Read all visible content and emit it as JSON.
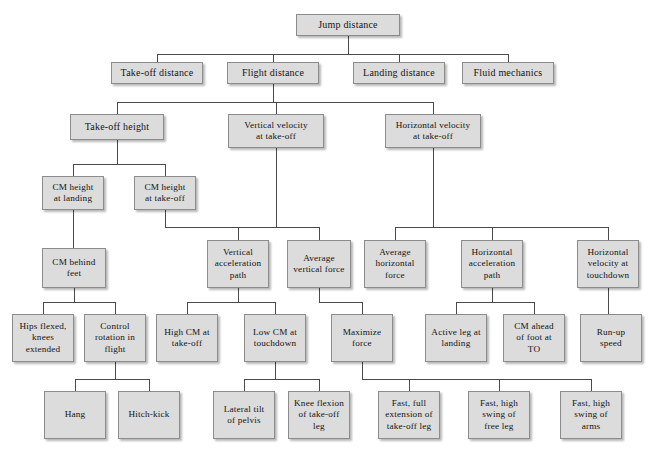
{
  "diagram": {
    "type": "hierarchy-tree",
    "title": "Jump distance",
    "box_fill": "#dcdcdc",
    "box_border": "#8c8c8c",
    "line_color": "#4a4a4a",
    "background": "#ffffff",
    "nodes": [
      {
        "id": "jump-distance",
        "label": "Jump distance",
        "level": 0,
        "x": 296,
        "y": 14,
        "w": 104,
        "h": 22
      },
      {
        "id": "take-off-distance",
        "label": "Take-off distance",
        "level": 1,
        "x": 111,
        "y": 62,
        "w": 92,
        "h": 22
      },
      {
        "id": "flight-distance",
        "label": "Flight distance",
        "level": 1,
        "x": 227,
        "y": 62,
        "w": 92,
        "h": 22
      },
      {
        "id": "landing-distance",
        "label": "Landing distance",
        "level": 1,
        "x": 353,
        "y": 62,
        "w": 92,
        "h": 22
      },
      {
        "id": "fluid-mechanics",
        "label": "Fluid mechanics",
        "level": 1,
        "x": 462,
        "y": 62,
        "w": 92,
        "h": 22
      },
      {
        "id": "take-off-height",
        "label": "Take-off height",
        "level": 2,
        "x": 70,
        "y": 114,
        "w": 94,
        "h": 26
      },
      {
        "id": "vertical-velocity-at-take-off",
        "label": "Vertical velocity\nat take-off",
        "level": 2,
        "x": 228,
        "y": 114,
        "w": 96,
        "h": 34
      },
      {
        "id": "horizontal-velocity-at-take-off",
        "label": "Horizontal velocity\nat take-off",
        "level": 2,
        "x": 385,
        "y": 114,
        "w": 96,
        "h": 34
      },
      {
        "id": "cm-height-at-landing",
        "label": "CM height\nat landing",
        "level": 3,
        "x": 42,
        "y": 176,
        "w": 62,
        "h": 34
      },
      {
        "id": "cm-height-at-take-off",
        "label": "CM height\nat take-off",
        "level": 3,
        "x": 134,
        "y": 176,
        "w": 62,
        "h": 34
      },
      {
        "id": "cm-behind-feet",
        "label": "CM behind\nfeet",
        "level": 4,
        "x": 42,
        "y": 248,
        "w": 64,
        "h": 40
      },
      {
        "id": "vertical-acceleration-path",
        "label": "Vertical\nacceleration\npath",
        "level": 4,
        "x": 207,
        "y": 240,
        "w": 62,
        "h": 48
      },
      {
        "id": "average-vertical-force",
        "label": "Average\nvertical force",
        "level": 4,
        "x": 287,
        "y": 240,
        "w": 64,
        "h": 48
      },
      {
        "id": "average-horizontal-force",
        "label": "Average\nhorizontal\nforce",
        "level": 4,
        "x": 364,
        "y": 240,
        "w": 62,
        "h": 48
      },
      {
        "id": "horizontal-acceleration-path",
        "label": "Horizontal\nacceleration\npath",
        "level": 4,
        "x": 461,
        "y": 240,
        "w": 62,
        "h": 48
      },
      {
        "id": "horizontal-velocity-at-touchdown",
        "label": "Horizontal\nvelocity at\ntouchdown",
        "level": 4,
        "x": 577,
        "y": 240,
        "w": 62,
        "h": 48
      },
      {
        "id": "hips-flexed-knees-extended",
        "label": "Hips flexed,\nknees\nextended",
        "level": 5,
        "x": 12,
        "y": 314,
        "w": 62,
        "h": 48
      },
      {
        "id": "control-rotation-in-flight",
        "label": "Control\nrotation in\nflight",
        "level": 5,
        "x": 84,
        "y": 314,
        "w": 62,
        "h": 48
      },
      {
        "id": "high-cm-at-take-off",
        "label": "High CM at\ntake-off",
        "level": 5,
        "x": 156,
        "y": 314,
        "w": 62,
        "h": 48
      },
      {
        "id": "low-cm-at-touchdown",
        "label": "Low CM at\ntouchdown",
        "level": 5,
        "x": 244,
        "y": 314,
        "w": 62,
        "h": 48
      },
      {
        "id": "maximize-force",
        "label": "Maximize\nforce",
        "level": 5,
        "x": 331,
        "y": 314,
        "w": 62,
        "h": 48
      },
      {
        "id": "active-leg-at-landing",
        "label": "Active leg at\nlanding",
        "level": 5,
        "x": 425,
        "y": 314,
        "w": 62,
        "h": 48
      },
      {
        "id": "cm-ahead-of-foot-at-to",
        "label": "CM ahead\nof foot at\nTO",
        "level": 5,
        "x": 503,
        "y": 314,
        "w": 62,
        "h": 48
      },
      {
        "id": "run-up-speed",
        "label": "Run-up\nspeed",
        "level": 5,
        "x": 580,
        "y": 314,
        "w": 62,
        "h": 48
      },
      {
        "id": "hang",
        "label": "Hang",
        "level": 6,
        "x": 44,
        "y": 391,
        "w": 62,
        "h": 48
      },
      {
        "id": "hitch-kick",
        "label": "Hitch-kick",
        "level": 6,
        "x": 118,
        "y": 391,
        "w": 62,
        "h": 48
      },
      {
        "id": "lateral-tilt-of-pelvis",
        "label": "Lateral tilt\nof pelvis",
        "level": 6,
        "x": 213,
        "y": 391,
        "w": 62,
        "h": 48
      },
      {
        "id": "knee-flexion-of-take-off-leg",
        "label": "Knee flexion\nof take-off\nleg",
        "level": 6,
        "x": 288,
        "y": 391,
        "w": 62,
        "h": 48
      },
      {
        "id": "fast-full-extension-of-take-off-leg",
        "label": "Fast, full\nextension of\ntake-off leg",
        "level": 6,
        "x": 378,
        "y": 391,
        "w": 62,
        "h": 48
      },
      {
        "id": "fast-high-swing-of-free-leg",
        "label": "Fast, high\nswing of\nfree leg",
        "level": 6,
        "x": 468,
        "y": 391,
        "w": 62,
        "h": 48
      },
      {
        "id": "fast-high-swing-of-arms",
        "label": "Fast, high\nswing of\narms",
        "level": 6,
        "x": 560,
        "y": 391,
        "w": 62,
        "h": 48
      }
    ],
    "edges": [
      {
        "id": "root-stem",
        "from": "jump-distance",
        "to": "bus-level1"
      },
      {
        "id": "bus-level1",
        "children": [
          "take-off-distance",
          "flight-distance",
          "landing-distance",
          "fluid-mechanics"
        ]
      },
      {
        "id": "flight-to-bus2",
        "from": "flight-distance",
        "children": [
          "take-off-height",
          "vertical-velocity-at-take-off",
          "horizontal-velocity-at-take-off"
        ]
      },
      {
        "id": "take-off-height-bus",
        "from": "take-off-height",
        "children": [
          "cm-height-at-landing",
          "cm-height-at-take-off"
        ]
      },
      {
        "id": "cm-landing-to-behind-feet",
        "from": "cm-height-at-landing",
        "children": [
          "cm-behind-feet"
        ]
      },
      {
        "id": "vertical-bus",
        "from": "vertical-velocity-at-take-off",
        "children": [
          "vertical-acceleration-path",
          "average-vertical-force"
        ],
        "joins": [
          "cm-height-at-take-off"
        ]
      },
      {
        "id": "horizontal-bus",
        "from": "horizontal-velocity-at-take-off",
        "children": [
          "average-horizontal-force",
          "horizontal-acceleration-path",
          "horizontal-velocity-at-touchdown"
        ]
      },
      {
        "id": "cm-behind-feet-bus",
        "from": "cm-behind-feet",
        "children": [
          "hips-flexed-knees-extended",
          "control-rotation-in-flight"
        ]
      },
      {
        "id": "vertical-path-bus",
        "from": "vertical-acceleration-path",
        "children": [
          "high-cm-at-take-off",
          "low-cm-at-touchdown"
        ]
      },
      {
        "id": "avg-vertical-to-maximize",
        "from": "average-vertical-force",
        "children": [
          "maximize-force"
        ]
      },
      {
        "id": "horizontal-path-bus",
        "from": "horizontal-acceleration-path",
        "children": [
          "active-leg-at-landing",
          "cm-ahead-of-foot-at-to"
        ]
      },
      {
        "id": "horizontal-touchdown-to-runup",
        "from": "horizontal-velocity-at-touchdown",
        "children": [
          "run-up-speed"
        ]
      },
      {
        "id": "control-rotation-bus",
        "from": "control-rotation-in-flight",
        "children": [
          "hang",
          "hitch-kick"
        ]
      },
      {
        "id": "low-cm-bus",
        "from": "low-cm-at-touchdown",
        "children": [
          "lateral-tilt-of-pelvis",
          "knee-flexion-of-take-off-leg"
        ]
      },
      {
        "id": "maximize-force-bus",
        "from": "maximize-force",
        "children": [
          "fast-full-extension-of-take-off-leg",
          "fast-high-swing-of-free-leg",
          "fast-high-swing-of-arms"
        ]
      }
    ]
  }
}
